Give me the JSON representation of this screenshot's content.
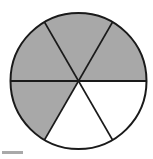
{
  "figure": {
    "background_color": "#ffffff"
  },
  "chart_data": {
    "type": "pie",
    "title": "",
    "subtitle": "",
    "xlabel": "",
    "ylabel": "",
    "legend_position": "none",
    "grid": false,
    "total_slices": 6,
    "slice_angle_degrees": 60,
    "shaded_count": 4,
    "unshaded_count": 2,
    "fraction_shaded": "4/6",
    "categories": [
      "slice-1",
      "slice-2",
      "slice-3",
      "slice-4",
      "slice-5",
      "slice-6"
    ],
    "values": [
      1,
      1,
      1,
      1,
      1,
      1
    ],
    "slices": [
      {
        "name": "slice-1",
        "start_angle": 0,
        "end_angle": 60,
        "fill": "#a8a8a8",
        "shaded": true,
        "position": "lower-right"
      },
      {
        "name": "slice-2",
        "start_angle": 60,
        "end_angle": 120,
        "fill": "#a8a8a8",
        "shaded": true,
        "position": "bottom"
      },
      {
        "name": "slice-3",
        "start_angle": 120,
        "end_angle": 180,
        "fill": "#a8a8a8",
        "shaded": true,
        "position": "lower-left"
      },
      {
        "name": "slice-4",
        "start_angle": 180,
        "end_angle": 240,
        "fill": "#a8a8a8",
        "shaded": true,
        "position": "upper-left"
      },
      {
        "name": "slice-5",
        "start_angle": 240,
        "end_angle": 300,
        "fill": "#ffffff",
        "shaded": false,
        "position": "top"
      },
      {
        "name": "slice-6",
        "start_angle": 300,
        "end_angle": 360,
        "fill": "#ffffff",
        "shaded": false,
        "position": "upper-right"
      }
    ],
    "geometry": {
      "center_x": 78.5,
      "center_y": 81,
      "radius": 68,
      "outline_color": "#1a1a1a",
      "outline_width": 2,
      "divider_color": "#1a1a1a",
      "divider_width": 1.8
    }
  },
  "caption_rule": {
    "label": "caption-rule",
    "color": "#a9a9a9"
  }
}
